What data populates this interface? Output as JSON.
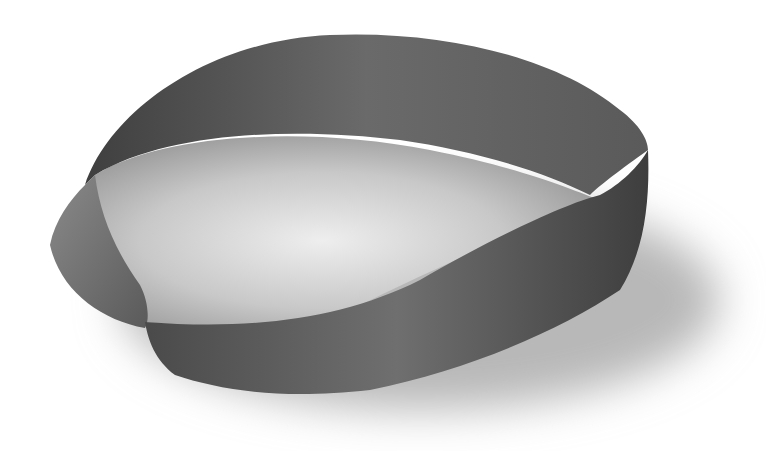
{
  "image": {
    "subject": "mobius-strip",
    "background_color": "#ffffff",
    "strip_dark_color": "#4a4a4a",
    "strip_mid_color": "#6e6e6e",
    "strip_light_color": "#8a8a8a",
    "shadow_color": "#bdbdbd"
  }
}
